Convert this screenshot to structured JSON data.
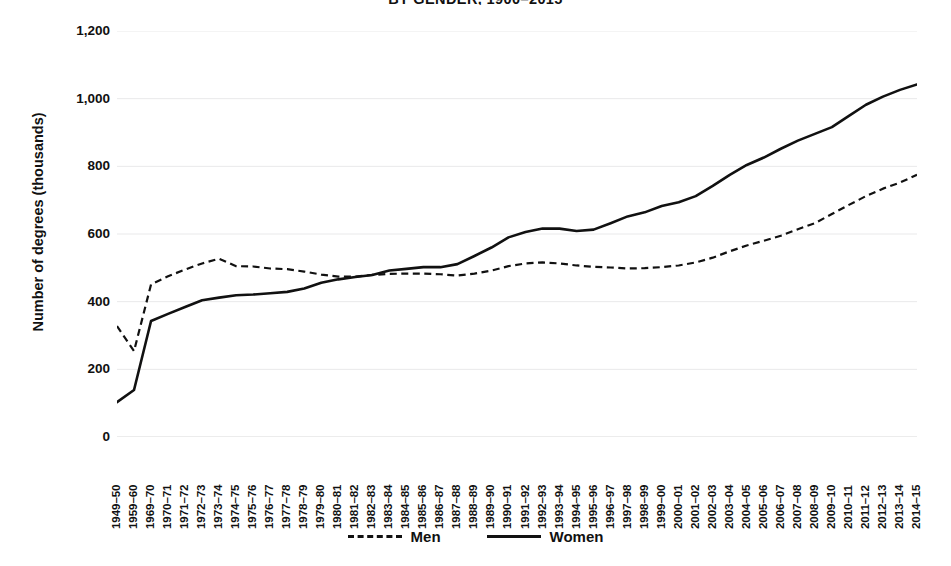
{
  "chart_data": {
    "type": "line",
    "title": "BY GENDER, 1900–2015",
    "xlabel": "",
    "ylabel": "Number of degrees (thousands)",
    "ylim": [
      0,
      1200
    ],
    "yticks": [
      "0",
      "200",
      "400",
      "600",
      "800",
      "1,000",
      "1,200"
    ],
    "ytick_values": [
      0,
      200,
      400,
      600,
      800,
      1000,
      1200
    ],
    "grid": true,
    "legend_position": "bottom-center",
    "categories": [
      "1949–50",
      "1959–60",
      "1969–70",
      "1970–71",
      "1971–72",
      "1972–73",
      "1973–74",
      "1974–75",
      "1975–76",
      "1976–77",
      "1977–78",
      "1978–79",
      "1979–80",
      "1980–81",
      "1981–82",
      "1982–83",
      "1983–84",
      "1984–85",
      "1985–86",
      "1986–87",
      "1987–88",
      "1988–89",
      "1989–90",
      "1990–91",
      "1991–92",
      "1992–93",
      "1993–94",
      "1994–95",
      "1995–96",
      "1996–97",
      "1997–98",
      "1998–99",
      "1999–00",
      "2000–01",
      "2001–02",
      "2002–03",
      "2003–04",
      "2004–05",
      "2005–06",
      "2006–07",
      "2007–08",
      "2008–09",
      "2009–10",
      "2010–11",
      "2011–12",
      "2012–13",
      "2013–14",
      "2014–15"
    ],
    "series": [
      {
        "name": "Men",
        "style": "dashed",
        "color": "#111111",
        "values": [
          328,
          254,
          451,
          475,
          495,
          513,
          527,
          505,
          504,
          498,
          496,
          489,
          480,
          474,
          474,
          479,
          482,
          483,
          483,
          481,
          477,
          483,
          492,
          505,
          513,
          516,
          513,
          507,
          503,
          501,
          498,
          499,
          502,
          507,
          516,
          530,
          549,
          566,
          580,
          595,
          614,
          632,
          659,
          686,
          712,
          734,
          752,
          775
        ]
      },
      {
        "name": "Women",
        "style": "solid",
        "color": "#111111",
        "values": [
          103,
          139,
          343,
          364,
          384,
          404,
          412,
          419,
          421,
          425,
          429,
          439,
          456,
          466,
          473,
          479,
          492,
          497,
          502,
          502,
          511,
          535,
          560,
          590,
          606,
          616,
          616,
          609,
          613,
          632,
          652,
          664,
          683,
          694,
          712,
          742,
          775,
          804,
          826,
          852,
          876,
          896,
          916,
          949,
          982,
          1006,
          1026,
          1042
        ]
      }
    ]
  },
  "legend": {
    "items": [
      {
        "label": "Men",
        "style": "dashed"
      },
      {
        "label": "Women",
        "style": "solid"
      }
    ]
  }
}
